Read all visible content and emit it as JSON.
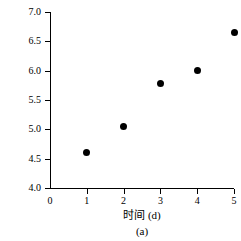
{
  "cropped_top_text": "— — — — — — — — — —",
  "chart_data": {
    "type": "scatter",
    "title": "",
    "caption": "(a)",
    "xlabel": "时间 (d)",
    "ylabel": "logN",
    "xlim": [
      0,
      5
    ],
    "ylim": [
      4.0,
      7.0
    ],
    "grid": false,
    "legend": null,
    "marker_color": "#000000",
    "axis_color": "#000000",
    "background_color": "#ffffff",
    "x_ticks": [
      "0",
      "1",
      "2",
      "3",
      "4",
      "5"
    ],
    "x_tick_values": [
      0,
      1,
      2,
      3,
      4,
      5
    ],
    "y_ticks": [
      "4.0",
      "4.5",
      "5.0",
      "5.5",
      "6.0",
      "6.5",
      "7.0"
    ],
    "y_tick_values": [
      4.0,
      4.5,
      5.0,
      5.5,
      6.0,
      6.5,
      7.0
    ],
    "x": [
      1,
      2,
      3,
      4,
      5
    ],
    "values": [
      4.6,
      5.05,
      5.78,
      6.0,
      6.65
    ],
    "points": [
      {
        "x": 1,
        "y": 4.6
      },
      {
        "x": 2,
        "y": 5.05
      },
      {
        "x": 3,
        "y": 5.78
      },
      {
        "x": 4,
        "y": 6.0
      },
      {
        "x": 5,
        "y": 6.65
      }
    ]
  }
}
